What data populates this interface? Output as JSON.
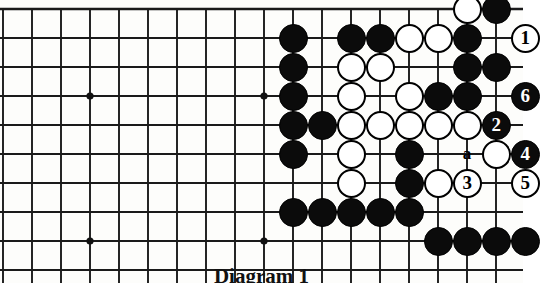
{
  "figure": {
    "kind": "go-board-diagram",
    "caption": "Diagram 1",
    "colors": {
      "black_stone": "#0b0b0b",
      "white_stone": "#ffffff",
      "grid_line": "#1a1a1a",
      "background": "#fdfdfb"
    }
  },
  "board": {
    "columns": 18,
    "rows": 9,
    "origin_x": 3,
    "origin_y": 9,
    "spacing": 29,
    "stone_radius": 14.5,
    "edges": {
      "top": true,
      "right": true,
      "left": false,
      "bottom": false
    },
    "star_points": [
      {
        "col": 3,
        "row": 3
      },
      {
        "col": 3,
        "row": 8
      },
      {
        "col": 9,
        "row": 3
      },
      {
        "col": 9,
        "row": 8
      },
      {
        "col": 15,
        "row": 8
      }
    ]
  },
  "stones": [
    {
      "col": 16,
      "row": 0,
      "color": "white",
      "label": ""
    },
    {
      "col": 17,
      "row": 0,
      "color": "black",
      "label": ""
    },
    {
      "col": 10,
      "row": 1,
      "color": "black",
      "label": ""
    },
    {
      "col": 12,
      "row": 1,
      "color": "black",
      "label": ""
    },
    {
      "col": 13,
      "row": 1,
      "color": "black",
      "label": ""
    },
    {
      "col": 14,
      "row": 1,
      "color": "white",
      "label": ""
    },
    {
      "col": 15,
      "row": 1,
      "color": "white",
      "label": ""
    },
    {
      "col": 16,
      "row": 1,
      "color": "black",
      "label": ""
    },
    {
      "col": 18,
      "row": 1,
      "color": "white",
      "label": "1"
    },
    {
      "col": 10,
      "row": 2,
      "color": "black",
      "label": ""
    },
    {
      "col": 12,
      "row": 2,
      "color": "white",
      "label": ""
    },
    {
      "col": 13,
      "row": 2,
      "color": "white",
      "label": ""
    },
    {
      "col": 16,
      "row": 2,
      "color": "black",
      "label": ""
    },
    {
      "col": 17,
      "row": 2,
      "color": "black",
      "label": ""
    },
    {
      "col": 10,
      "row": 3,
      "color": "black",
      "label": ""
    },
    {
      "col": 12,
      "row": 3,
      "color": "white",
      "label": ""
    },
    {
      "col": 14,
      "row": 3,
      "color": "white",
      "label": ""
    },
    {
      "col": 15,
      "row": 3,
      "color": "black",
      "label": ""
    },
    {
      "col": 16,
      "row": 3,
      "color": "black",
      "label": ""
    },
    {
      "col": 18,
      "row": 3,
      "color": "black",
      "label": "6"
    },
    {
      "col": 10,
      "row": 4,
      "color": "black",
      "label": ""
    },
    {
      "col": 11,
      "row": 4,
      "color": "black",
      "label": ""
    },
    {
      "col": 12,
      "row": 4,
      "color": "white",
      "label": ""
    },
    {
      "col": 13,
      "row": 4,
      "color": "white",
      "label": ""
    },
    {
      "col": 14,
      "row": 4,
      "color": "white",
      "label": ""
    },
    {
      "col": 15,
      "row": 4,
      "color": "white",
      "label": ""
    },
    {
      "col": 16,
      "row": 4,
      "color": "white",
      "label": ""
    },
    {
      "col": 17,
      "row": 4,
      "color": "black",
      "label": "2"
    },
    {
      "col": 10,
      "row": 5,
      "color": "black",
      "label": ""
    },
    {
      "col": 12,
      "row": 5,
      "color": "white",
      "label": ""
    },
    {
      "col": 14,
      "row": 5,
      "color": "black",
      "label": ""
    },
    {
      "col": 17,
      "row": 5,
      "color": "white",
      "label": ""
    },
    {
      "col": 18,
      "row": 5,
      "color": "black",
      "label": "4"
    },
    {
      "col": 12,
      "row": 6,
      "color": "white",
      "label": ""
    },
    {
      "col": 14,
      "row": 6,
      "color": "black",
      "label": ""
    },
    {
      "col": 15,
      "row": 6,
      "color": "white",
      "label": ""
    },
    {
      "col": 16,
      "row": 6,
      "color": "white",
      "label": "3"
    },
    {
      "col": 18,
      "row": 6,
      "color": "white",
      "label": "5"
    },
    {
      "col": 10,
      "row": 7,
      "color": "black",
      "label": ""
    },
    {
      "col": 11,
      "row": 7,
      "color": "black",
      "label": ""
    },
    {
      "col": 12,
      "row": 7,
      "color": "black",
      "label": ""
    },
    {
      "col": 13,
      "row": 7,
      "color": "black",
      "label": ""
    },
    {
      "col": 14,
      "row": 7,
      "color": "black",
      "label": ""
    },
    {
      "col": 15,
      "row": 8,
      "color": "black",
      "label": ""
    },
    {
      "col": 16,
      "row": 8,
      "color": "black",
      "label": ""
    },
    {
      "col": 17,
      "row": 8,
      "color": "black",
      "label": ""
    },
    {
      "col": 18,
      "row": 8,
      "color": "black",
      "label": ""
    }
  ],
  "point_markers": [
    {
      "col": 16,
      "row": 5,
      "text": "a"
    }
  ],
  "move_sequence": [
    {
      "number": "1",
      "color": "white"
    },
    {
      "number": "2",
      "color": "black"
    },
    {
      "number": "3",
      "color": "white"
    },
    {
      "number": "4",
      "color": "black"
    },
    {
      "number": "5",
      "color": "white"
    },
    {
      "number": "6",
      "color": "black"
    }
  ]
}
